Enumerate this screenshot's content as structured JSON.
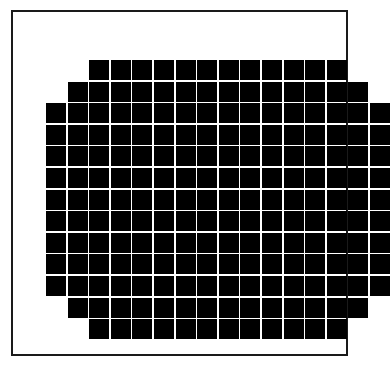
{
  "figure": {
    "background_color": "#ffffff",
    "frame": {
      "name": "outer-border",
      "color": "#1a1a1a",
      "border_width_px": 2,
      "left_px": 11,
      "top_px": 10,
      "width_px": 337,
      "height_px": 346
    }
  },
  "chart_data": {
    "type": "heatmap",
    "title": "",
    "subtitle": "",
    "xlabel": "",
    "ylabel": "",
    "legend": [],
    "annotations": [],
    "grid": false,
    "columns": 16,
    "rows": 13,
    "cell_size_px": 20,
    "cell_gap_px": 1.6,
    "fill_color": "#000000",
    "empty_color": "#ffffff",
    "shape": "octagon",
    "total_filled_cells": 196,
    "row_labels": [
      "1",
      "2",
      "3",
      "4",
      "5",
      "6",
      "7",
      "8",
      "9",
      "10",
      "11",
      "12",
      "13"
    ],
    "column_labels": [
      "1",
      "2",
      "3",
      "4",
      "5",
      "6",
      "7",
      "8",
      "9",
      "10",
      "11",
      "12",
      "13",
      "14",
      "15",
      "16"
    ],
    "row_offsets": [
      2,
      1,
      0,
      0,
      0,
      0,
      0,
      0,
      0,
      0,
      0,
      1,
      2
    ],
    "row_counts": [
      12,
      14,
      16,
      16,
      16,
      16,
      16,
      16,
      16,
      16,
      16,
      14,
      12
    ],
    "values": [
      [
        0,
        0,
        1,
        1,
        1,
        1,
        1,
        1,
        1,
        1,
        1,
        1,
        1,
        1,
        0,
        0
      ],
      [
        0,
        1,
        1,
        1,
        1,
        1,
        1,
        1,
        1,
        1,
        1,
        1,
        1,
        1,
        1,
        0
      ],
      [
        1,
        1,
        1,
        1,
        1,
        1,
        1,
        1,
        1,
        1,
        1,
        1,
        1,
        1,
        1,
        1
      ],
      [
        1,
        1,
        1,
        1,
        1,
        1,
        1,
        1,
        1,
        1,
        1,
        1,
        1,
        1,
        1,
        1
      ],
      [
        1,
        1,
        1,
        1,
        1,
        1,
        1,
        1,
        1,
        1,
        1,
        1,
        1,
        1,
        1,
        1
      ],
      [
        1,
        1,
        1,
        1,
        1,
        1,
        1,
        1,
        1,
        1,
        1,
        1,
        1,
        1,
        1,
        1
      ],
      [
        1,
        1,
        1,
        1,
        1,
        1,
        1,
        1,
        1,
        1,
        1,
        1,
        1,
        1,
        1,
        1
      ],
      [
        1,
        1,
        1,
        1,
        1,
        1,
        1,
        1,
        1,
        1,
        1,
        1,
        1,
        1,
        1,
        1
      ],
      [
        1,
        1,
        1,
        1,
        1,
        1,
        1,
        1,
        1,
        1,
        1,
        1,
        1,
        1,
        1,
        1
      ],
      [
        1,
        1,
        1,
        1,
        1,
        1,
        1,
        1,
        1,
        1,
        1,
        1,
        1,
        1,
        1,
        1
      ],
      [
        1,
        1,
        1,
        1,
        1,
        1,
        1,
        1,
        1,
        1,
        1,
        1,
        1,
        1,
        1,
        1
      ],
      [
        0,
        1,
        1,
        1,
        1,
        1,
        1,
        1,
        1,
        1,
        1,
        1,
        1,
        1,
        1,
        0
      ],
      [
        0,
        0,
        1,
        1,
        1,
        1,
        1,
        1,
        1,
        1,
        1,
        1,
        1,
        1,
        0,
        0
      ]
    ],
    "layout": {
      "grid_left_px": 33,
      "grid_top_px": 48,
      "row_pitch_px": 21.6,
      "col_pitch_px": 21.6
    }
  }
}
